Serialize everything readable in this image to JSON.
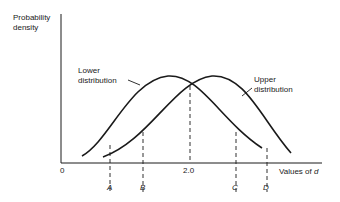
{
  "figure": {
    "y_axis_label_line1": "Probability",
    "y_axis_label_line2": "density",
    "x_axis_label_prefix": "Values of ",
    "x_axis_label_var": "d",
    "origin_label": "0",
    "center_tick_label": "2.0",
    "lower_label_line1": "Lower",
    "lower_label_line2": "distribution",
    "upper_label_line1": "Upper",
    "upper_label_line2": "distribution",
    "markers": [
      {
        "label": "A"
      },
      {
        "label": "B"
      },
      {
        "label": "C"
      },
      {
        "label": "D"
      }
    ]
  },
  "colors": {
    "line": "#1a1a1a",
    "background": "#ffffff"
  }
}
